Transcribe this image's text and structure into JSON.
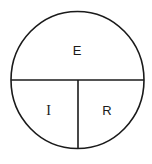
{
  "diagram": {
    "type": "partitioned-circle",
    "stroke_color": "#1a1a1a",
    "background": "#ffffff",
    "regions": [
      {
        "id": "top",
        "label": "E"
      },
      {
        "id": "bottom-left",
        "label": "I"
      },
      {
        "id": "bottom-right",
        "label": "R"
      }
    ]
  }
}
